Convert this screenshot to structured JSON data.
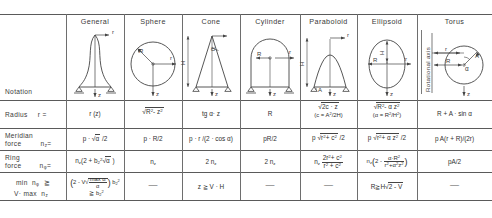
{
  "table": {
    "title": "Membrane forces of rotational shells",
    "row_labels": [
      {
        "id": "notation",
        "line1": "Notation",
        "line2": "",
        "symbol": ""
      },
      {
        "id": "radius",
        "line1": "Radius",
        "line2": "",
        "symbol": "r ="
      },
      {
        "id": "meridian",
        "line1": "Meridian",
        "line2": "force",
        "symbol": "n_z ="
      },
      {
        "id": "ring",
        "line1": "Ring",
        "line2": "force",
        "symbol": "n_phi ="
      },
      {
        "id": "min",
        "line1": "min  nφ   ≥",
        "line2": "V · max  n₂",
        "symbol": ""
      }
    ],
    "columns": [
      {
        "id": "general",
        "header": "General"
      },
      {
        "id": "sphere",
        "header": "Sphere"
      },
      {
        "id": "cone",
        "header": "Cone"
      },
      {
        "id": "cylinder",
        "header": "Cylinder"
      },
      {
        "id": "paraboloid",
        "header": "Paraboloid"
      },
      {
        "id": "ellipsoid",
        "header": "Ellipsoid"
      },
      {
        "id": "torus",
        "header": "Torus"
      }
    ],
    "radius_row": {
      "general": "r (z)",
      "sphere": "√(R² - z²)",
      "cone": "tg α · z",
      "cylinder": "R",
      "paraboloid": "√(2c · z)    (c = A²/2H)",
      "ellipsoid": "√(R² - α z²)    (α = R²/H²)",
      "torus": "R + A · sin α"
    },
    "meridian_row": {
      "general": "p · √α /2",
      "sphere": "p · R/2",
      "cone": "p · r /(2 · cos α)",
      "cylinder": "pR/2",
      "paraboloid": "p √(r² + c²) /2",
      "ellipsoid": "p √(r² + α z²) /2",
      "torus": "p A(r + R)/(2r)"
    },
    "ring_row": {
      "general": "n_z (2 + b²₂ √α )",
      "sphere": "n_z",
      "cone": "2 n_z",
      "cylinder": "2 n_z",
      "paraboloid": "n_z (2r² + c²)/(r² + c²)",
      "ellipsoid": "n_z (2 - αR²/(r² + α² z²))",
      "torus": "pA/2"
    },
    "min_row": {
      "general": "(2 - V √(max α / α)) b²₂   ≥ b²₂",
      "sphere": "—",
      "cone": "z ≥ V · H",
      "cylinder": "—",
      "paraboloid": "—",
      "ellipsoid": "R ≥ H √(2 - V)",
      "torus": "—"
    },
    "diagram_labels": {
      "r": "r",
      "z": "z",
      "R": "R",
      "H": "H",
      "A": "A",
      "alpha": "α",
      "rotational_axis": "Rotational  axis"
    }
  }
}
